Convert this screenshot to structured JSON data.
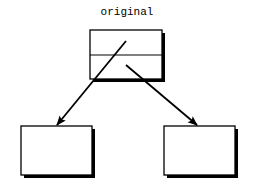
{
  "diagram": {
    "title": "original",
    "colors": {
      "stroke": "#000000",
      "fill": "#ffffff",
      "shadow": "#000000",
      "background": "#ffffff"
    },
    "nodes": [
      {
        "id": "original",
        "label": "",
        "compartments": 2,
        "x": 90,
        "y": 30,
        "w": 72,
        "h": 49
      },
      {
        "id": "left-child",
        "label": "",
        "x": 21,
        "y": 126,
        "w": 71,
        "h": 49
      },
      {
        "id": "right-child",
        "label": "",
        "x": 164,
        "y": 126,
        "w": 71,
        "h": 49
      }
    ],
    "edges": [
      {
        "from": "original",
        "to": "left-child",
        "x1": 126,
        "y1": 41,
        "x2": 57,
        "y2": 125
      },
      {
        "from": "original",
        "to": "right-child",
        "x1": 126,
        "y1": 65,
        "x2": 197,
        "y2": 125
      }
    ]
  }
}
